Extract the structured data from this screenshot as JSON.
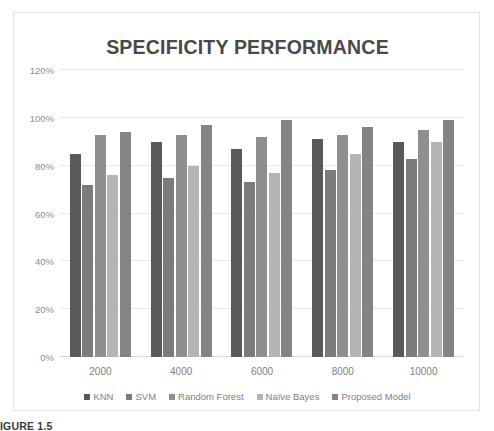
{
  "chart_data": {
    "type": "bar",
    "title": "SPECIFICITY PERFORMANCE",
    "xlabel": "",
    "ylabel": "",
    "categories": [
      "2000",
      "4000",
      "6000",
      "8000",
      "10000"
    ],
    "ylim": [
      0,
      120
    ],
    "ytick_labels": [
      "0%",
      "20%",
      "40%",
      "60%",
      "80%",
      "100%",
      "120%"
    ],
    "ytick_values": [
      0,
      20,
      40,
      60,
      80,
      100,
      120
    ],
    "grid": true,
    "legend_position": "bottom",
    "series": [
      {
        "name": "KNN",
        "color": "#595959",
        "values": [
          85,
          90,
          87,
          91,
          90
        ]
      },
      {
        "name": "SVM",
        "color": "#7b7b7b",
        "values": [
          72,
          75,
          73,
          78,
          83
        ]
      },
      {
        "name": "Random Forest",
        "color": "#8f8f8f",
        "values": [
          93,
          93,
          92,
          93,
          95
        ]
      },
      {
        "name": "Naïve Bayes",
        "color": "#b4b4b4",
        "values": [
          76,
          80,
          77,
          85,
          90
        ]
      },
      {
        "name": "Proposed Model",
        "color": "#848484",
        "values": [
          94,
          97,
          99,
          96,
          99
        ]
      }
    ]
  },
  "caption": {
    "text": "IGURE 1.5"
  }
}
